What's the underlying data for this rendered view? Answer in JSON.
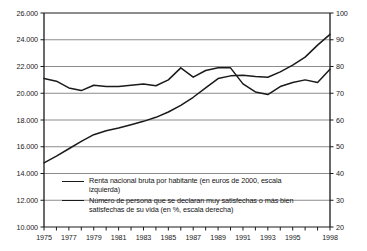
{
  "chart_data": {
    "type": "line",
    "title": "",
    "subtitle": "",
    "xlabel": "",
    "ylabel_left": "",
    "ylabel_right": "",
    "grid": true,
    "legend_position": "inside-bottom-left",
    "x": [
      1975,
      1976,
      1977,
      1978,
      1979,
      1980,
      1981,
      1982,
      1983,
      1984,
      1985,
      1986,
      1987,
      1988,
      1989,
      1990,
      1991,
      1992,
      1993,
      1994,
      1995,
      1996,
      1997,
      1998
    ],
    "x_tick_labels": [
      "1975",
      "1977",
      "1979",
      "1981",
      "1983",
      "1985",
      "1987",
      "1989",
      "1991",
      "1993",
      "1995",
      "1998"
    ],
    "x_tick_values": [
      1975,
      1977,
      1979,
      1981,
      1983,
      1985,
      1987,
      1989,
      1991,
      1993,
      1995,
      1998
    ],
    "xlim": [
      1975,
      1998
    ],
    "ylim_left": [
      10000,
      26000
    ],
    "ylim_right": [
      20,
      100
    ],
    "y_left_ticks": [
      10000,
      12000,
      14000,
      16000,
      18000,
      20000,
      22000,
      24000,
      26000
    ],
    "y_left_tick_labels": [
      "10.000",
      "12.000",
      "14.000",
      "16.000",
      "18.000",
      "20.000",
      "22.000",
      "24.000",
      "26.000"
    ],
    "y_right_ticks": [
      20,
      30,
      40,
      50,
      60,
      70,
      80,
      90,
      100
    ],
    "y_right_tick_labels": [
      "20",
      "30",
      "40",
      "50",
      "60",
      "70",
      "80",
      "90",
      "100"
    ],
    "series": [
      {
        "name": "Renta nacional bruta por habitante (en euros de 2000, escala izquierda)",
        "axis": "left",
        "color": "#1a1a1a",
        "values": [
          14800,
          15300,
          15850,
          16400,
          16900,
          17200,
          17400,
          17650,
          17900,
          18200,
          18600,
          19100,
          19700,
          20400,
          21100,
          21300,
          21350,
          21250,
          21200,
          21600,
          22100,
          22700,
          23600,
          24400
        ]
      },
      {
        "name": "Número de persona que se declaran muy satisfechas o más bien satisfechas de su vida (en %, escala derecha)",
        "axis": "right",
        "color": "#1a1a1a",
        "values": [
          75.5,
          74.5,
          72.0,
          71.0,
          73.0,
          72.5,
          72.5,
          73.0,
          73.5,
          72.8,
          75.0,
          79.5,
          76.0,
          78.5,
          79.5,
          79.5,
          73.5,
          70.5,
          69.5,
          72.5,
          74.0,
          75.0,
          74.0,
          79.0
        ]
      }
    ]
  },
  "legend": {
    "items": [
      {
        "label": "Renta nacional bruta por habitante (en euros de 2000, escala izquierda)",
        "color": "#1a1a1a"
      },
      {
        "label": "Número de persona que se declaran muy satisfechas o más bien satisfechas de su vida (en %, escala derecha)",
        "color": "#1a1a1a"
      }
    ]
  },
  "style": {
    "grid_color": "#8c8c8c",
    "axis_color": "#1a1a1a",
    "background": "#ffffff"
  }
}
